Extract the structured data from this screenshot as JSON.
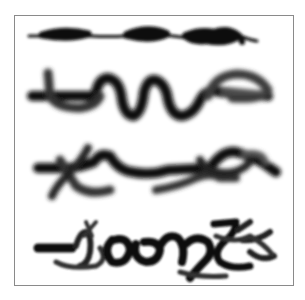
{
  "image": {
    "description": "Four rows of blurred black brush-stroke scribbles inside a thin gray frame",
    "frame_color": "#8a8a8a",
    "background": "#ffffff",
    "stroke_color": "#111111",
    "rows": [
      {
        "id": "row-1",
        "style": "thin line with thick blobs"
      },
      {
        "id": "row-2",
        "style": "wavy looping stroke"
      },
      {
        "id": "row-3",
        "style": "tangled zigzag strokes"
      },
      {
        "id": "row-4",
        "style": "dense scribble"
      }
    ]
  }
}
